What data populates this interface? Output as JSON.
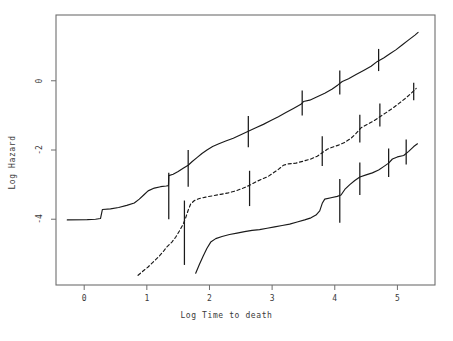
{
  "chart_data": {
    "type": "line",
    "title": "",
    "subtitle": "",
    "xlabel": "Log Time to death",
    "ylabel": "Log Hazard",
    "xlim": [
      -0.45,
      5.6
    ],
    "ylim": [
      -5.9,
      1.9
    ],
    "xticks": [
      0,
      1,
      2,
      3,
      4,
      5
    ],
    "xticklabels": [
      "0",
      "1",
      "2",
      "3",
      "4",
      "5"
    ],
    "yticks": [
      0,
      -2,
      -4
    ],
    "yticklabels": [
      "0",
      "-2",
      "-4"
    ],
    "grid": false,
    "legend": null,
    "annotations": [],
    "series": [
      {
        "name": "curve-upper",
        "linestyle": "solid",
        "color": "#1a1a1a",
        "points": [
          [
            -0.27,
            -4.02
          ],
          [
            0.05,
            -4.01
          ],
          [
            0.18,
            -4.0
          ],
          [
            0.26,
            -3.98
          ],
          [
            0.29,
            -3.72
          ],
          [
            0.42,
            -3.7
          ],
          [
            0.55,
            -3.66
          ],
          [
            0.68,
            -3.6
          ],
          [
            0.8,
            -3.53
          ],
          [
            0.88,
            -3.42
          ],
          [
            0.95,
            -3.3
          ],
          [
            1.02,
            -3.18
          ],
          [
            1.12,
            -3.1
          ],
          [
            1.22,
            -3.06
          ],
          [
            1.31,
            -3.04
          ],
          [
            1.345,
            -3.03
          ],
          [
            1.35,
            -2.74
          ],
          [
            1.42,
            -2.7
          ],
          [
            1.5,
            -2.62
          ],
          [
            1.58,
            -2.53
          ],
          [
            1.66,
            -2.44
          ],
          [
            1.72,
            -2.34
          ],
          [
            1.8,
            -2.22
          ],
          [
            1.88,
            -2.1
          ],
          [
            1.96,
            -2.0
          ],
          [
            2.05,
            -1.9
          ],
          [
            2.15,
            -1.82
          ],
          [
            2.26,
            -1.74
          ],
          [
            2.38,
            -1.66
          ],
          [
            2.5,
            -1.56
          ],
          [
            2.62,
            -1.46
          ],
          [
            2.74,
            -1.36
          ],
          [
            2.86,
            -1.26
          ],
          [
            2.98,
            -1.15
          ],
          [
            3.1,
            -1.04
          ],
          [
            3.22,
            -0.92
          ],
          [
            3.34,
            -0.8
          ],
          [
            3.46,
            -0.68
          ],
          [
            3.5,
            -0.6
          ],
          [
            3.6,
            -0.56
          ],
          [
            3.72,
            -0.46
          ],
          [
            3.84,
            -0.36
          ],
          [
            3.96,
            -0.24
          ],
          [
            4.05,
            -0.12
          ],
          [
            4.12,
            -0.02
          ],
          [
            4.22,
            0.06
          ],
          [
            4.34,
            0.18
          ],
          [
            4.46,
            0.3
          ],
          [
            4.58,
            0.42
          ],
          [
            4.68,
            0.56
          ],
          [
            4.78,
            0.66
          ],
          [
            4.88,
            0.78
          ],
          [
            4.98,
            0.9
          ],
          [
            5.08,
            1.04
          ],
          [
            5.18,
            1.18
          ],
          [
            5.28,
            1.32
          ],
          [
            5.33,
            1.4
          ]
        ],
        "error_bars": [
          {
            "x": 1.35,
            "y": -2.92,
            "lo": -4.0,
            "hi": -2.66
          },
          {
            "x": 1.66,
            "y": -2.46,
            "lo": -3.06,
            "hi": -2.0
          },
          {
            "x": 2.62,
            "y": -1.46,
            "lo": -1.92,
            "hi": -1.02
          },
          {
            "x": 3.48,
            "y": -0.62,
            "lo": -1.0,
            "hi": -0.28
          },
          {
            "x": 4.08,
            "y": -0.06,
            "lo": -0.4,
            "hi": 0.3
          },
          {
            "x": 4.7,
            "y": 0.58,
            "lo": 0.28,
            "hi": 0.92
          }
        ]
      },
      {
        "name": "curve-middle",
        "linestyle": "dashed",
        "color": "#1a1a1a",
        "points": [
          [
            0.86,
            -5.62
          ],
          [
            0.95,
            -5.48
          ],
          [
            1.02,
            -5.38
          ],
          [
            1.1,
            -5.24
          ],
          [
            1.18,
            -5.1
          ],
          [
            1.26,
            -4.94
          ],
          [
            1.32,
            -4.8
          ],
          [
            1.4,
            -4.66
          ],
          [
            1.46,
            -4.52
          ],
          [
            1.52,
            -4.34
          ],
          [
            1.58,
            -4.14
          ],
          [
            1.62,
            -3.96
          ],
          [
            1.66,
            -3.74
          ],
          [
            1.7,
            -3.56
          ],
          [
            1.76,
            -3.46
          ],
          [
            1.84,
            -3.4
          ],
          [
            1.94,
            -3.36
          ],
          [
            2.06,
            -3.32
          ],
          [
            2.18,
            -3.28
          ],
          [
            2.3,
            -3.24
          ],
          [
            2.42,
            -3.18
          ],
          [
            2.54,
            -3.1
          ],
          [
            2.64,
            -3.02
          ],
          [
            2.74,
            -2.92
          ],
          [
            2.84,
            -2.84
          ],
          [
            2.94,
            -2.76
          ],
          [
            3.02,
            -2.66
          ],
          [
            3.1,
            -2.56
          ],
          [
            3.18,
            -2.44
          ],
          [
            3.26,
            -2.4
          ],
          [
            3.38,
            -2.38
          ],
          [
            3.5,
            -2.32
          ],
          [
            3.62,
            -2.26
          ],
          [
            3.72,
            -2.18
          ],
          [
            3.8,
            -2.08
          ],
          [
            3.88,
            -1.98
          ],
          [
            3.96,
            -1.92
          ],
          [
            4.06,
            -1.86
          ],
          [
            4.16,
            -1.78
          ],
          [
            4.26,
            -1.66
          ],
          [
            4.34,
            -1.52
          ],
          [
            4.42,
            -1.36
          ],
          [
            4.52,
            -1.26
          ],
          [
            4.62,
            -1.16
          ],
          [
            4.72,
            -1.04
          ],
          [
            4.82,
            -0.92
          ],
          [
            4.92,
            -0.8
          ],
          [
            5.02,
            -0.66
          ],
          [
            5.12,
            -0.52
          ],
          [
            5.22,
            -0.36
          ],
          [
            5.3,
            -0.22
          ]
        ],
        "error_bars": [
          {
            "x": 1.6,
            "y": -4.06,
            "lo": -5.32,
            "hi": -3.46
          },
          {
            "x": 2.64,
            "y": -3.02,
            "lo": -3.62,
            "hi": -2.6
          },
          {
            "x": 3.8,
            "y": -2.08,
            "lo": -2.46,
            "hi": -1.6
          },
          {
            "x": 4.4,
            "y": -1.38,
            "lo": -1.78,
            "hi": -0.98
          },
          {
            "x": 4.72,
            "y": -1.04,
            "lo": -1.32,
            "hi": -0.66
          },
          {
            "x": 5.26,
            "y": -0.3,
            "lo": -0.56,
            "hi": -0.06
          }
        ]
      },
      {
        "name": "curve-lower",
        "linestyle": "solid",
        "color": "#1a1a1a",
        "points": [
          [
            1.78,
            -5.56
          ],
          [
            1.84,
            -5.3
          ],
          [
            1.9,
            -5.06
          ],
          [
            1.96,
            -4.84
          ],
          [
            2.02,
            -4.66
          ],
          [
            2.1,
            -4.56
          ],
          [
            2.2,
            -4.5
          ],
          [
            2.32,
            -4.44
          ],
          [
            2.44,
            -4.4
          ],
          [
            2.56,
            -4.36
          ],
          [
            2.68,
            -4.32
          ],
          [
            2.8,
            -4.3
          ],
          [
            2.92,
            -4.26
          ],
          [
            3.04,
            -4.22
          ],
          [
            3.16,
            -4.18
          ],
          [
            3.28,
            -4.14
          ],
          [
            3.4,
            -4.08
          ],
          [
            3.52,
            -4.02
          ],
          [
            3.62,
            -3.96
          ],
          [
            3.7,
            -3.88
          ],
          [
            3.76,
            -3.76
          ],
          [
            3.8,
            -3.54
          ],
          [
            3.84,
            -3.42
          ],
          [
            3.94,
            -3.38
          ],
          [
            4.04,
            -3.34
          ],
          [
            4.1,
            -3.3
          ],
          [
            4.16,
            -3.14
          ],
          [
            4.24,
            -3.0
          ],
          [
            4.32,
            -2.88
          ],
          [
            4.4,
            -2.78
          ],
          [
            4.5,
            -2.72
          ],
          [
            4.6,
            -2.66
          ],
          [
            4.7,
            -2.58
          ],
          [
            4.78,
            -2.48
          ],
          [
            4.86,
            -2.38
          ],
          [
            4.92,
            -2.26
          ],
          [
            5.0,
            -2.2
          ],
          [
            5.1,
            -2.16
          ],
          [
            5.18,
            -2.04
          ],
          [
            5.26,
            -1.9
          ],
          [
            5.32,
            -1.82
          ]
        ],
        "error_bars": [
          {
            "x": 4.08,
            "y": -3.32,
            "lo": -4.1,
            "hi": -2.84
          },
          {
            "x": 4.4,
            "y": -2.78,
            "lo": -3.3,
            "hi": -2.36
          },
          {
            "x": 4.86,
            "y": -2.38,
            "lo": -2.78,
            "hi": -1.96
          },
          {
            "x": 5.14,
            "y": -2.06,
            "lo": -2.42,
            "hi": -1.7
          }
        ]
      }
    ]
  },
  "frame": {
    "border_color": "#6e6e6e",
    "background": "#ffffff"
  }
}
